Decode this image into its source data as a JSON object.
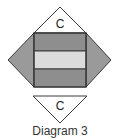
{
  "diagram": {
    "top_label": "C",
    "bottom_label": "C",
    "caption": "Diagram 3"
  },
  "colors": {
    "dark_fill": "#8e8e8e",
    "light_fill": "#dcdcdc",
    "side_fill": "#9a9a9a",
    "top_fill": "#ffffff",
    "stroke": "#3a3a3a"
  }
}
